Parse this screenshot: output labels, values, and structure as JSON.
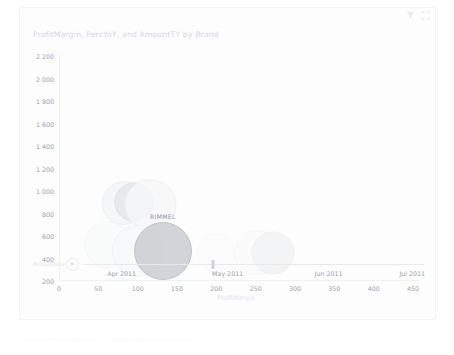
{
  "card": {
    "title": "ProfitMargin, PercYoY, and AmountTY by Brand",
    "header_icons": [
      {
        "name": "filter-icon",
        "glyph": "filter"
      },
      {
        "name": "focus-mode-icon",
        "glyph": "focus"
      }
    ]
  },
  "chart_data": {
    "type": "scatter",
    "title": "ProfitMargin, PercYoY, and AmountTY by Brand",
    "xlabel": "ProfitMargin",
    "ylabel": "",
    "size_measure": "AmountTY",
    "xlim": [
      0,
      450
    ],
    "ylim": [
      200,
      2200
    ],
    "grid": false,
    "legend": "none",
    "x_ticks": [
      "0",
      "50",
      "100",
      "150",
      "200",
      "250",
      "300",
      "350",
      "400",
      "450"
    ],
    "x_tick_values": [
      0,
      50,
      100,
      150,
      200,
      250,
      300,
      350,
      400,
      450
    ],
    "y_ticks": [
      "200",
      "400",
      "600",
      "800",
      "1 000",
      "1 200",
      "1 400",
      "1 600",
      "1 800",
      "2 000",
      "2 200"
    ],
    "y_tick_values": [
      200,
      400,
      600,
      800,
      1000,
      1200,
      1400,
      1600,
      1800,
      2000,
      2200
    ],
    "points": [
      {
        "label": "",
        "x": 82,
        "y": 895,
        "size": 120,
        "fill": "#f4f5f6",
        "stroke": "#eceef0",
        "opacity": 0.85
      },
      {
        "label": "",
        "x": 95,
        "y": 905,
        "size": 95,
        "fill": "#e6e8ea",
        "stroke": "#dddfe2",
        "opacity": 0.9
      },
      {
        "label": "",
        "x": 116,
        "y": 880,
        "size": 165,
        "fill": "#f7f8f9",
        "stroke": "#eef0f1",
        "opacity": 0.8
      },
      {
        "label": "",
        "x": 62,
        "y": 520,
        "size": 140,
        "fill": "#fafbfb",
        "stroke": "#f3f4f5",
        "opacity": 0.75
      },
      {
        "label": "",
        "x": 100,
        "y": 470,
        "size": 170,
        "fill": "#f8f9fa",
        "stroke": "#eef0f1",
        "opacity": 0.8
      },
      {
        "label": "RIMMEL",
        "x": 132,
        "y": 468,
        "size": 210,
        "fill": "#cfd2d6",
        "stroke": "#bfc3c8",
        "opacity": 0.95
      },
      {
        "label": "",
        "x": 200,
        "y": 452,
        "size": 90,
        "fill": "#fcfcfd",
        "stroke": "#f6f7f8",
        "opacity": 0.7
      },
      {
        "label": "",
        "x": 252,
        "y": 452,
        "size": 130,
        "fill": "#fbfbfc",
        "stroke": "#f4f5f6",
        "opacity": 0.7
      },
      {
        "label": "",
        "x": 272,
        "y": 452,
        "size": 115,
        "fill": "#f2f3f4",
        "stroke": "#eceef0",
        "opacity": 0.8
      }
    ]
  },
  "play_axis": {
    "field_label": "ActualDate",
    "play_button_label": "Play",
    "ticks": [
      "Apr 2011",
      "May 2011",
      "Jun 2011",
      "Jul 2011"
    ],
    "tick_positions": [
      0.11,
      0.42,
      0.715,
      0.96
    ],
    "handle_position": 0.38
  },
  "footer": {
    "caption": "Source: sample sales model — bubble chart over play axis"
  }
}
